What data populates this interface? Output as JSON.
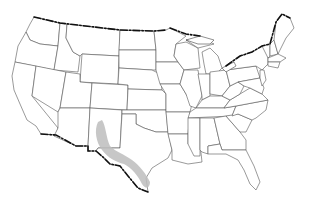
{
  "map": {
    "region": "Contiguous United States",
    "style": "state outline map",
    "colors": {
      "background": "#ffffff",
      "state_fill": "#ffffff",
      "state_border": "#555555",
      "international_border": "#111111",
      "range_fill": "#bdbdbd"
    },
    "highlighted_range": {
      "description": "Shaded distribution range from central New Mexico down along the Rio Grande to southern Texas",
      "areas": [
        "New Mexico",
        "West Texas",
        "Rio Grande valley",
        "South Texas"
      ]
    },
    "labels": []
  }
}
